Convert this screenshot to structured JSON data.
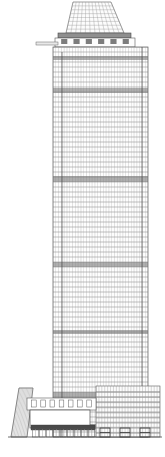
{
  "drawing": {
    "type": "architectural-elevation",
    "subject": "high-rise-tower-with-podium",
    "orientation": "front-elevation",
    "canvas": {
      "width": 165,
      "height": 457
    },
    "background_color": "#ffffff",
    "line_color": "#5a5a5a",
    "fine_line_color": "#9a9a9a",
    "band_color": "#6e6e6e",
    "ground_line_color": "#4a4a4a"
  },
  "tower": {
    "name": "main-tower-shaft",
    "left": 53,
    "right": 148,
    "top": 47,
    "bottom": 437,
    "floor_count": 78,
    "floor_height_px": 5.0,
    "mullion_count": 34,
    "facade_pattern": "curtain-wall-grid",
    "setback_strip": {
      "name": "left-setback-strip",
      "left": 53,
      "right": 62,
      "top": 52,
      "bottom": 437
    },
    "right_edge_strip": {
      "name": "right-edge-strip",
      "left": 142,
      "right": 148,
      "top": 47,
      "bottom": 437
    },
    "mechanical_bands": [
      {
        "label": "mech-band-1",
        "y": 56,
        "height": 4
      },
      {
        "label": "mech-band-2",
        "y": 88,
        "height": 5
      },
      {
        "label": "mech-band-3",
        "y": 176,
        "height": 6
      },
      {
        "label": "mech-band-4",
        "y": 262,
        "height": 5
      },
      {
        "label": "mech-band-5",
        "y": 330,
        "height": 4
      },
      {
        "label": "mech-band-6",
        "y": 392,
        "height": 7
      },
      {
        "label": "mech-band-7",
        "y": 424,
        "height": 5
      }
    ]
  },
  "crown": {
    "name": "tapered-crown",
    "top": 2,
    "bottom": 33,
    "top_left": 73,
    "top_right": 111,
    "bottom_left": 66,
    "bottom_right": 124,
    "grid_rows": 8,
    "grid_cols": 12
  },
  "crown_cap": {
    "name": "crown-cap-band",
    "left": 58,
    "right": 131,
    "top": 33,
    "bottom": 38
  },
  "crown_base": {
    "name": "crown-base-block",
    "left": 55,
    "right": 135,
    "top": 38,
    "bottom": 47,
    "fin_count": 6
  },
  "mast": {
    "name": "outrigger-mast",
    "left": 36,
    "right": 58,
    "y": 42,
    "thickness": 3
  },
  "podium": {
    "name": "podium-base",
    "top": 386,
    "bottom": 437,
    "left": 10,
    "right": 160,
    "elements": [
      {
        "name": "angled-west-wing",
        "shape": "trapezoid",
        "bottom_left": 11,
        "bottom_right": 27,
        "top_left": 19,
        "top_right": 33,
        "top": 388,
        "bottom": 437,
        "mullion_count": 11
      },
      {
        "name": "upper-setback-block",
        "left": 27,
        "right": 96,
        "top": 398,
        "bottom": 410,
        "window_count": 7
      },
      {
        "name": "main-entry-volume",
        "left": 30,
        "right": 90,
        "top": 410,
        "bottom": 428
      },
      {
        "name": "entry-canopy-band",
        "left": 31,
        "right": 95,
        "top": 425,
        "bottom": 430
      },
      {
        "name": "storefront-bay-row",
        "left": 32,
        "right": 95,
        "top": 429,
        "bottom": 437,
        "bay_count": 9
      },
      {
        "name": "east-podium-block",
        "left": 96,
        "right": 160,
        "top": 386,
        "bottom": 437,
        "band_rows": 5
      },
      {
        "name": "colonnade-piers",
        "left": 100,
        "right": 150,
        "top": 428,
        "bottom": 437,
        "pier_count": 3
      }
    ]
  },
  "ground_line": {
    "name": "ground-datum-line",
    "left": 8,
    "right": 162,
    "y": 437
  }
}
